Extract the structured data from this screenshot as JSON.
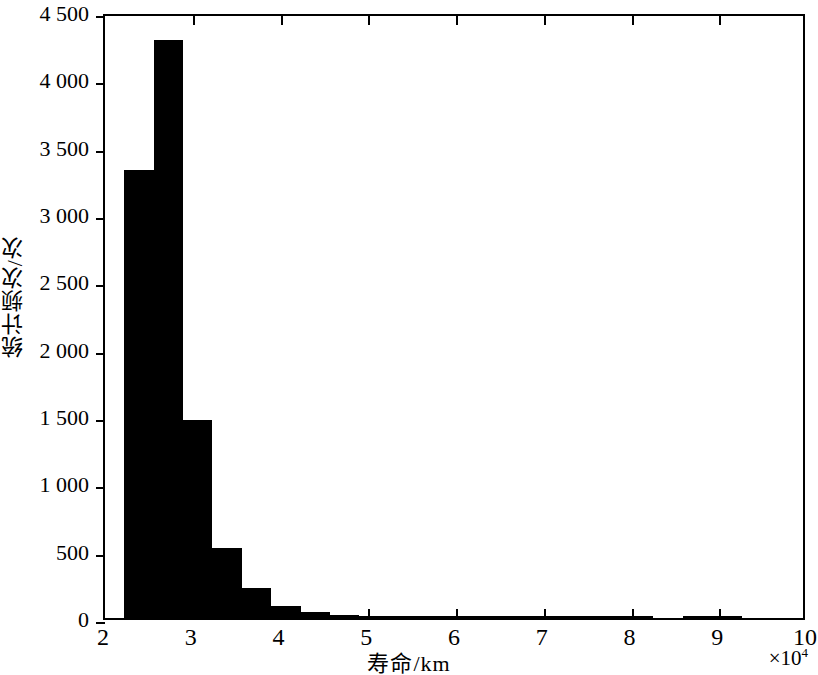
{
  "chart_data": {
    "type": "bar",
    "title": "",
    "subtitle": "",
    "xlabel": "寿命/km",
    "ylabel": "统计频次/次",
    "x_exponent": "×10",
    "x_exponent_power": "4",
    "xlim": [
      2,
      10
    ],
    "ylim": [
      0,
      4500
    ],
    "grid": false,
    "legend": null,
    "bar_color": "#000000",
    "background_color": "#ffffff",
    "axis_color": "#000000",
    "xticks": [
      "2",
      "3",
      "4",
      "5",
      "6",
      "7",
      "8",
      "9",
      "10"
    ],
    "xtick_values": [
      2,
      3,
      4,
      5,
      6,
      7,
      8,
      9,
      10
    ],
    "yticks": [
      "0",
      "500",
      "1 000",
      "1 500",
      "2 000",
      "2 500",
      "3 000",
      "3 500",
      "4 000",
      "4 500"
    ],
    "ytick_values": [
      0,
      500,
      1000,
      1500,
      2000,
      2500,
      3000,
      3500,
      4000,
      4500
    ],
    "bin_width": 0.335,
    "bins": [
      {
        "x0": 2.22,
        "x1": 2.555,
        "value": 3330
      },
      {
        "x0": 2.555,
        "x1": 2.89,
        "value": 4290
      },
      {
        "x0": 2.89,
        "x1": 3.225,
        "value": 1470
      },
      {
        "x0": 3.225,
        "x1": 3.56,
        "value": 520
      },
      {
        "x0": 3.56,
        "x1": 3.895,
        "value": 225
      },
      {
        "x0": 3.895,
        "x1": 4.23,
        "value": 92
      },
      {
        "x0": 4.23,
        "x1": 4.565,
        "value": 48
      },
      {
        "x0": 4.565,
        "x1": 4.9,
        "value": 22
      },
      {
        "x0": 4.9,
        "x1": 5.235,
        "value": 12
      },
      {
        "x0": 5.235,
        "x1": 5.57,
        "value": 8
      },
      {
        "x0": 5.57,
        "x1": 5.905,
        "value": 6
      },
      {
        "x0": 5.905,
        "x1": 6.24,
        "value": 5
      },
      {
        "x0": 6.24,
        "x1": 6.575,
        "value": 4
      },
      {
        "x0": 6.575,
        "x1": 6.91,
        "value": 2
      },
      {
        "x0": 6.91,
        "x1": 7.245,
        "value": 3
      },
      {
        "x0": 7.245,
        "x1": 7.58,
        "value": 4
      },
      {
        "x0": 7.58,
        "x1": 7.915,
        "value": 5
      },
      {
        "x0": 7.915,
        "x1": 8.25,
        "value": 6
      },
      {
        "x0": 8.25,
        "x1": 8.585,
        "value": 0
      },
      {
        "x0": 8.585,
        "x1": 8.92,
        "value": 4
      },
      {
        "x0": 8.92,
        "x1": 9.255,
        "value": 5
      },
      {
        "x0": 9.255,
        "x1": 9.59,
        "value": 0
      }
    ]
  }
}
